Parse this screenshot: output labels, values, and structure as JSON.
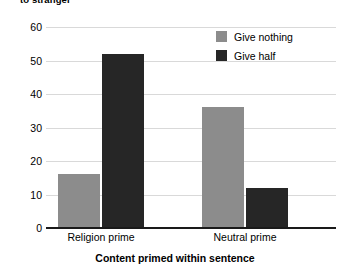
{
  "chart_data": {
    "type": "bar",
    "title": "to stranger",
    "xlabel": "Content primed within sentence",
    "ylabel": "",
    "categories": [
      "Religion prime",
      "Neutral prime"
    ],
    "series": [
      {
        "name": "Give nothing",
        "color": "#8c8c8c",
        "values": [
          16,
          36
        ]
      },
      {
        "name": "Give half",
        "color": "#262626",
        "values": [
          52,
          12
        ]
      }
    ],
    "ylim": [
      0,
      60
    ],
    "yticks": [
      0,
      10,
      20,
      30,
      40,
      50,
      60
    ],
    "ytick_labels": [
      "0",
      "10",
      "20",
      "30",
      "40",
      "50",
      "60"
    ],
    "grid": true,
    "legend_position": "top-right"
  },
  "legend": {
    "entries": [
      {
        "label": "Give nothing",
        "color": "#8c8c8c"
      },
      {
        "label": "Give half",
        "color": "#262626"
      }
    ]
  },
  "axis": {
    "y_tick_60": "60",
    "y_tick_50": "50",
    "y_tick_40": "40",
    "y_tick_30": "30",
    "y_tick_20": "20",
    "y_tick_10": "10",
    "y_tick_0": "0",
    "x_cat_0": "Religion prime",
    "x_cat_1": "Neutral prime",
    "x_title": "Content primed within sentence"
  },
  "title": {
    "text": "to stranger"
  }
}
